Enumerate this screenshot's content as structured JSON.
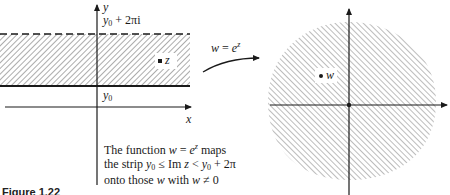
{
  "figure": {
    "label": "Figure 1.22",
    "caption_lines": [
      "The function w = e^z maps",
      "the strip y0 ≤ Im z < y0 + 2π",
      "onto those w with w ≠ 0"
    ],
    "caption": {
      "line1_pre": "The function ",
      "line1_w": "w",
      "line1_eq": " = ",
      "line1_e": "e",
      "line1_z": "z",
      "line1_post": " maps",
      "line2_pre": "the strip ",
      "line2_y": "y",
      "line2_sub0": "0",
      "line2_le": " ≤ Im ",
      "line2_z": "z",
      "line2_lt": " < ",
      "line2_y2": "y",
      "line2_sub0b": "0",
      "line2_post": " + 2π",
      "line3_pre": "onto those ",
      "line3_w": "w",
      "line3_mid": " with ",
      "line3_w2": "w",
      "line3_post": " ≠ 0"
    }
  },
  "left_plane": {
    "y_axis_label": "y",
    "x_axis_label": "x",
    "top_boundary_label": {
      "y": "y",
      "sub": "0",
      "rest": " + 2πi"
    },
    "bottom_boundary_label": {
      "y": "y",
      "sub": "0"
    },
    "point_label": "z",
    "top_boundary_style": "dashed",
    "bottom_boundary_style": "solid",
    "hatch_direction": "backslash"
  },
  "mapping_arrow": {
    "w": "w",
    "eq": " = ",
    "e": "e",
    "exp": "z"
  },
  "right_plane": {
    "point_label": "w",
    "region": "disk-shaped hatched region (whole plane minus origin)",
    "hatch_direction": "slash"
  },
  "colors": {
    "ink": "#1a1a1a",
    "hatch": "#5a5a5a",
    "background": "#ffffff"
  }
}
